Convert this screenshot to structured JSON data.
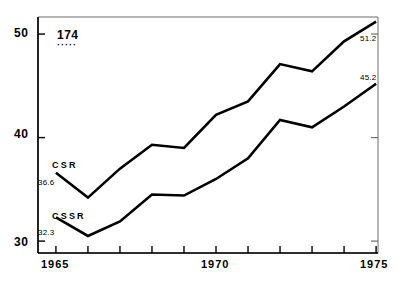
{
  "chart_data": {
    "type": "line",
    "title": "",
    "subtitle": "",
    "xlabel": "",
    "ylabel": "",
    "xlim": [
      1964.44,
      1975.06
    ],
    "ylim": [
      28.85,
      51.65
    ],
    "grid": false,
    "legend_position": "inline-left",
    "x": [
      1965,
      1966,
      1967,
      1968,
      1969,
      1970,
      1971,
      1972,
      1973,
      1974,
      1975
    ],
    "xticks": [
      1965,
      1966,
      1967,
      1968,
      1969,
      1970,
      1971,
      1972,
      1973,
      1974,
      1975
    ],
    "xticklabels": [
      "1965",
      "",
      "",
      "",
      "",
      "1970",
      "",
      "",
      "",
      "",
      "1975"
    ],
    "yticks": [
      30,
      40,
      50
    ],
    "yticklabels": [
      "30",
      "40",
      "50"
    ],
    "series": [
      {
        "name": "CSR",
        "color": "#000000",
        "start_label": "36.6",
        "end_label": "51.2",
        "values": [
          36.6,
          34.2,
          37.0,
          39.3,
          39.0,
          42.2,
          43.5,
          47.1,
          46.4,
          49.3,
          51.2
        ]
      },
      {
        "name": "CSSR",
        "color": "#000000",
        "start_label": "32.3",
        "end_label": "45.2",
        "values": [
          32.3,
          30.5,
          31.9,
          34.5,
          34.4,
          36.0,
          38.0,
          41.7,
          41.0,
          43.0,
          45.2
        ]
      }
    ],
    "annotations": [
      {
        "name": "figure-number",
        "text": "174",
        "underline": "·····"
      }
    ]
  },
  "axes": {
    "y_labels": [
      "50",
      "40",
      "30"
    ],
    "x_labels": [
      "1965",
      "1970",
      "1975"
    ]
  }
}
